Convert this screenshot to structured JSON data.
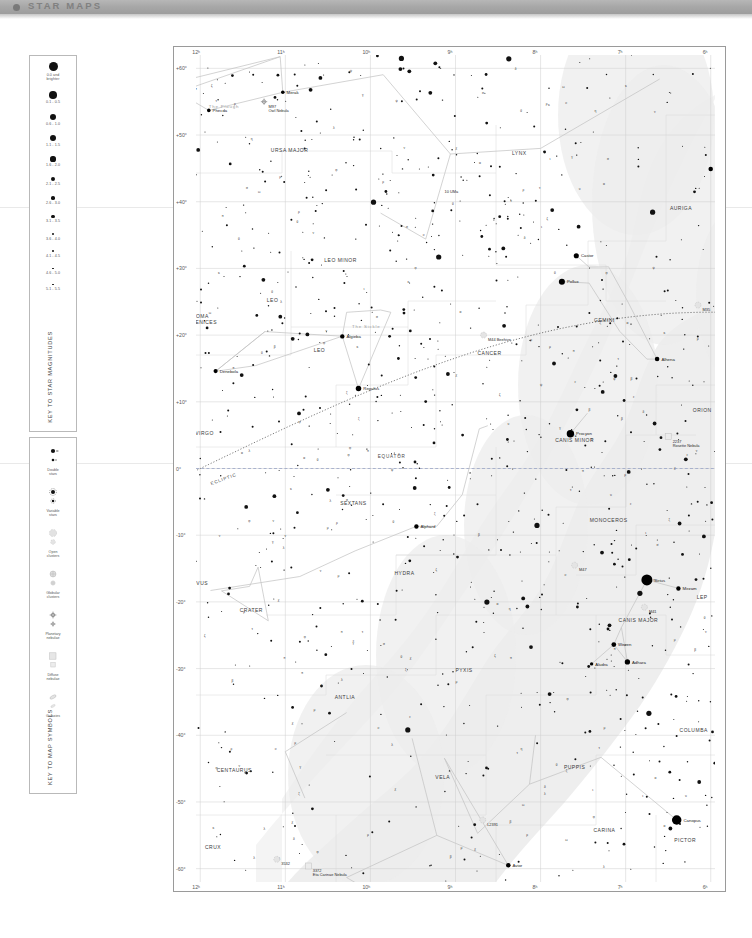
{
  "header": {
    "title": "STAR MAPS",
    "bullet_icon": "bullet-icon"
  },
  "legend_magnitudes": {
    "vertical_title": "KEY TO STAR MAGNITUDES",
    "items": [
      {
        "label": "0.0 and\nbrighter",
        "size": 9.0
      },
      {
        "label": "0.1 - 0.5",
        "size": 7.6
      },
      {
        "label": "0.6 - 1.0",
        "size": 6.8
      },
      {
        "label": "1.1 - 1.5",
        "size": 6.0
      },
      {
        "label": "1.6 - 2.0",
        "size": 5.2
      },
      {
        "label": "2.1 - 2.5",
        "size": 4.4
      },
      {
        "label": "2.6 - 3.0",
        "size": 3.7
      },
      {
        "label": "3.1 - 3.5",
        "size": 3.1
      },
      {
        "label": "3.6 - 4.0",
        "size": 2.6
      },
      {
        "label": "4.1 - 4.5",
        "size": 2.1
      },
      {
        "label": "4.6 - 5.0",
        "size": 1.7
      },
      {
        "label": "5.1 - 5.5",
        "size": 1.3
      }
    ]
  },
  "legend_symbols": {
    "vertical_title": "KEY TO MAP SYMBOLS",
    "items": [
      {
        "name": "double-stars-symbol",
        "label": "Double\nstars"
      },
      {
        "name": "variable-stars-symbol",
        "label": "Variable\nstars"
      },
      {
        "name": "open-clusters-symbol",
        "label": "Open\nclusters"
      },
      {
        "name": "globular-clusters-symbol",
        "label": "Globular\nclusters"
      },
      {
        "name": "planetary-nebulae-symbol",
        "label": "Planetary\nnebulae"
      },
      {
        "name": "diffuse-nebulae-symbol",
        "label": "Diffuse\nnebulae"
      },
      {
        "name": "galaxies-symbol",
        "label": "Galaxies"
      }
    ]
  },
  "chart_data": {
    "type": "scatter",
    "xlabel": "Right Ascension",
    "ylabel": "Declination",
    "grid": true,
    "xlim": [
      12,
      6
    ],
    "ylim": [
      -60,
      60
    ],
    "ra_ticks": [
      "12ʰ",
      "11ʰ",
      "10ʰ",
      "9ʰ",
      "8ʰ",
      "7ʰ",
      "6ʰ"
    ],
    "dec_ticks": [
      "+60°",
      "+50°",
      "+40°",
      "+30°",
      "+20°",
      "+10°",
      "0°",
      "-10°",
      "-20°",
      "-30°",
      "-40°",
      "-50°",
      "-60°"
    ],
    "annotations": [
      {
        "text": "EQUATOR",
        "ra": 9.75,
        "dec": 1.6
      },
      {
        "text": "ECLIPTIC",
        "ra": 11.72,
        "dec": -1.8
      },
      {
        "text": "The Plough",
        "ra": 11.72,
        "dec": 54.0
      },
      {
        "text": "The Sickle",
        "ra": 10.05,
        "dec": 21.0
      }
    ],
    "constellations": [
      {
        "name": "URSA MAJOR",
        "ra": 10.95,
        "dec": 47.5
      },
      {
        "name": "LYNX",
        "ra": 8.25,
        "dec": 47.0
      },
      {
        "name": "AURIGA",
        "ra": 6.35,
        "dec": 38.8
      },
      {
        "name": "LEO MINOR",
        "ra": 10.35,
        "dec": 31.0
      },
      {
        "name": "COMA\nBERENICES",
        "ra": 12.0,
        "dec": 22.5
      },
      {
        "name": "LEO",
        "ra": 11.15,
        "dec": 25.0
      },
      {
        "name": "LEO",
        "ra": 10.6,
        "dec": 17.5
      },
      {
        "name": "CANCER",
        "ra": 8.6,
        "dec": 17.0
      },
      {
        "name": "GEMINI",
        "ra": 7.25,
        "dec": 22.0
      },
      {
        "name": "ORION",
        "ra": 6.1,
        "dec": 8.5
      },
      {
        "name": "CANIS MINOR",
        "ra": 7.6,
        "dec": 4.0
      },
      {
        "name": "VIRGO",
        "ra": 11.95,
        "dec": 5.0
      },
      {
        "name": "SEXTANS",
        "ra": 10.2,
        "dec": -5.5
      },
      {
        "name": "HYDRA",
        "ra": 9.6,
        "dec": -16.0
      },
      {
        "name": "MONOCEROS",
        "ra": 7.2,
        "dec": -8.0
      },
      {
        "name": "CANIS MAJOR",
        "ra": 6.85,
        "dec": -23.0
      },
      {
        "name": "LEP",
        "ra": 6.1,
        "dec": -19.5
      },
      {
        "name": "CORVUS",
        "ra": 12.05,
        "dec": -17.5
      },
      {
        "name": "CRATER",
        "ra": 11.4,
        "dec": -21.5
      },
      {
        "name": "PYXIS",
        "ra": 8.9,
        "dec": -30.5
      },
      {
        "name": "ANTLIA",
        "ra": 10.3,
        "dec": -34.5
      },
      {
        "name": "COLUMBA",
        "ra": 6.2,
        "dec": -39.5
      },
      {
        "name": "CENTAURUS",
        "ra": 11.6,
        "dec": -45.5
      },
      {
        "name": "VELA",
        "ra": 9.15,
        "dec": -46.5
      },
      {
        "name": "PUPPIS",
        "ra": 7.6,
        "dec": -45.0
      },
      {
        "name": "CARINA",
        "ra": 7.25,
        "dec": -54.5
      },
      {
        "name": "PICTOR",
        "ra": 6.3,
        "dec": -56.0
      },
      {
        "name": "CRUX",
        "ra": 11.85,
        "dec": -57.0
      }
    ],
    "named_stars": [
      {
        "name": "Megrez",
        "ra": 12.25,
        "dec": 57.0,
        "mag": 3.3
      },
      {
        "name": "Phecda",
        "ra": 11.9,
        "dec": 53.7,
        "mag": 2.4
      },
      {
        "name": "Merak",
        "ra": 11.03,
        "dec": 56.4,
        "mag": 2.4
      },
      {
        "name": "Castor",
        "ra": 7.58,
        "dec": 31.9,
        "mag": 1.6
      },
      {
        "name": "Pollux",
        "ra": 7.75,
        "dec": 28.0,
        "mag": 1.1
      },
      {
        "name": "Alhena",
        "ra": 6.63,
        "dec": 16.4,
        "mag": 1.9
      },
      {
        "name": "Procyon",
        "ra": 7.65,
        "dec": 5.2,
        "mag": 0.4
      },
      {
        "name": "Regulus",
        "ra": 10.14,
        "dec": 12.0,
        "mag": 1.4
      },
      {
        "name": "Algieba",
        "ra": 10.33,
        "dec": 19.8,
        "mag": 2.0
      },
      {
        "name": "Denebola",
        "ra": 11.82,
        "dec": 14.6,
        "mag": 2.1
      },
      {
        "name": "Alphard",
        "ra": 9.46,
        "dec": -8.7,
        "mag": 2.0
      },
      {
        "name": "Sirius",
        "ra": 6.75,
        "dec": -16.7,
        "mag": -1.5
      },
      {
        "name": "Mirzam",
        "ra": 6.38,
        "dec": -18.0,
        "mag": 2.0
      },
      {
        "name": "Wezen",
        "ra": 7.14,
        "dec": -26.4,
        "mag": 1.8
      },
      {
        "name": "Adhara",
        "ra": 6.98,
        "dec": -29.0,
        "mag": 1.5
      },
      {
        "name": "Aludra",
        "ra": 7.4,
        "dec": -29.3,
        "mag": 2.5
      },
      {
        "name": "Canopus",
        "ra": 6.4,
        "dec": -52.7,
        "mag": -0.7
      },
      {
        "name": "Avior",
        "ra": 8.38,
        "dec": -59.5,
        "mag": 1.9
      },
      {
        "name": "Gacrux",
        "ra": 12.52,
        "dec": -57.1,
        "mag": 1.6
      },
      {
        "name": "Menkalinan",
        "ra": 6.0,
        "dec": 44.9,
        "mag": 1.9
      }
    ],
    "deep_sky": [
      {
        "name": "M97\nOwl Nebula",
        "ra": 11.25,
        "dec": 55.0,
        "kind": "planetary"
      },
      {
        "name": "M44 Beehive",
        "ra": 8.67,
        "dec": 20.0,
        "kind": "open"
      },
      {
        "name": "M35",
        "ra": 6.15,
        "dec": 24.5,
        "kind": "open"
      },
      {
        "name": "2237\nRosette Nebula",
        "ra": 6.5,
        "dec": 4.8,
        "kind": "diffuse"
      },
      {
        "name": "M41",
        "ra": 6.78,
        "dec": -20.8,
        "kind": "open"
      },
      {
        "name": "M47",
        "ra": 7.6,
        "dec": -14.5,
        "kind": "open"
      },
      {
        "name": "3532",
        "ra": 11.1,
        "dec": -58.6,
        "kind": "open"
      },
      {
        "name": "3372\nEta Carinae Nebula",
        "ra": 10.73,
        "dec": -59.6,
        "kind": "diffuse"
      },
      {
        "name": "10 UMa",
        "ra": 9.0,
        "dec": 41.5,
        "kind": "star-label"
      },
      {
        "name": "L2391",
        "ra": 8.68,
        "dec": -52.7,
        "kind": "open"
      }
    ],
    "milky_way": "shaded irregular band running from upper-right (Auriga/Gemini) down through Monoceros, Canis Major, Puppis, Vela to Crux at lower-left"
  }
}
